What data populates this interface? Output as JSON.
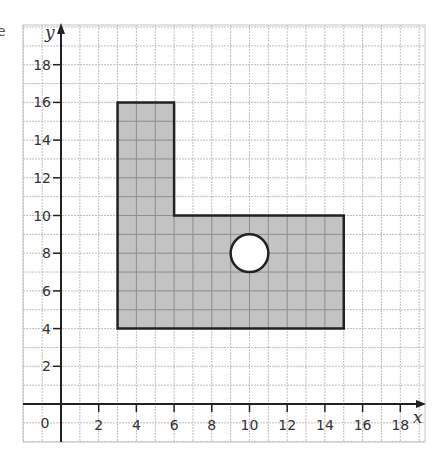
{
  "chart_data": {
    "type": "diagram-plot",
    "title": "",
    "xlabel": "x",
    "ylabel": "y",
    "origin_label": "0",
    "xlim": [
      -2,
      19.5
    ],
    "ylim": [
      -2,
      20
    ],
    "grid": true,
    "grid_step": 1,
    "x_ticks": [
      2,
      4,
      6,
      8,
      10,
      12,
      14,
      16,
      18
    ],
    "y_ticks": [
      2,
      4,
      6,
      8,
      10,
      12,
      14,
      16,
      18
    ],
    "x_tick_labels": [
      "2",
      "4",
      "6",
      "8",
      "10",
      "12",
      "14",
      "16",
      "18"
    ],
    "y_tick_labels": [
      "2",
      "4",
      "6",
      "8",
      "10",
      "12",
      "14",
      "16",
      "18"
    ],
    "shapes": [
      {
        "name": "L-shape",
        "type": "polygon",
        "fill": "#b8b8b8",
        "stroke": "#222222",
        "vertices": [
          [
            3,
            4
          ],
          [
            3,
            16
          ],
          [
            6,
            16
          ],
          [
            6,
            10
          ],
          [
            15,
            10
          ],
          [
            15,
            4
          ]
        ]
      },
      {
        "name": "hole",
        "type": "circle",
        "fill": "#ffffff",
        "stroke": "#222222",
        "center": [
          10,
          8
        ],
        "radius": 1
      }
    ]
  },
  "fragment_text": "e"
}
